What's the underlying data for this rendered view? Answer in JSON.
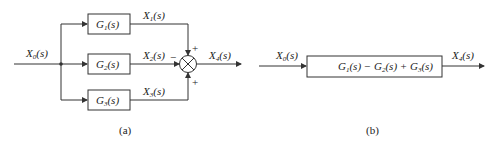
{
  "diagram_a": {
    "caption": "(a)",
    "input_label": "X0(s)",
    "blocks": [
      {
        "label": "G1(s)",
        "output": "X1(s)",
        "sign": "+"
      },
      {
        "label": "G2(s)",
        "output": "X2(s)",
        "sign": "−"
      },
      {
        "label": "G3(s)",
        "output": "X3(s)",
        "sign": "+"
      }
    ],
    "summing_junction": "summing-point",
    "output_label": "X4(s)"
  },
  "diagram_b": {
    "caption": "(b)",
    "input_label": "X0(s)",
    "block_label": "G1(s) − G2(s) + G3(s)",
    "output_label": "X4(s)"
  },
  "colors": {
    "line": "#333333",
    "background": "#ffffff"
  }
}
